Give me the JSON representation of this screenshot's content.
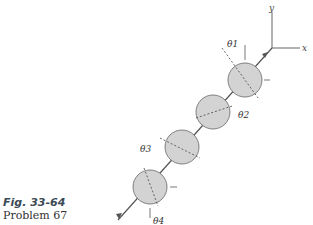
{
  "figure": {
    "caption": "Fig. 33-64",
    "subcaption": "Problem 67",
    "axes": {
      "x_label": "x",
      "y_label": "y"
    },
    "angles": [
      "θ1",
      "θ2",
      "θ3",
      "θ4"
    ],
    "colors": {
      "disk_fill": "#d3d3d3",
      "line": "#555555",
      "caption": "#3a4a55"
    }
  }
}
